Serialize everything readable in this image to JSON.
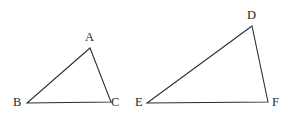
{
  "figure": {
    "type": "geometry-diagram",
    "background_color": "#ffffff",
    "stroke_color": "#2b2b2b",
    "label_color": "#262626",
    "canvas": {
      "width": 293,
      "height": 120
    },
    "shapes": [
      {
        "id": "triangle-abc",
        "name": "Triangle ABC",
        "points": "90,48 27,103 111,102",
        "vertices": [
          {
            "label": "A",
            "x": 90,
            "y": 48
          },
          {
            "label": "B",
            "x": 27,
            "y": 103
          },
          {
            "label": "C",
            "x": 111,
            "y": 102
          }
        ]
      },
      {
        "id": "triangle-def",
        "name": "Triangle DEF",
        "points": "252,26 147,103 268,102",
        "vertices": [
          {
            "label": "D",
            "x": 252,
            "y": 26
          },
          {
            "label": "E",
            "x": 147,
            "y": 103
          },
          {
            "label": "F",
            "x": 268,
            "y": 102
          }
        ]
      }
    ],
    "labels": [
      {
        "id": "label-a",
        "text": "A",
        "left": 85,
        "top": 31
      },
      {
        "id": "label-b",
        "text": "B",
        "left": 13,
        "top": 96
      },
      {
        "id": "label-c",
        "text": "C",
        "left": 111,
        "top": 96
      },
      {
        "id": "label-d",
        "text": "D",
        "left": 247,
        "top": 9
      },
      {
        "id": "label-e",
        "text": "E",
        "left": 135,
        "top": 96
      },
      {
        "id": "label-f",
        "text": "F",
        "left": 272,
        "top": 96
      }
    ]
  }
}
